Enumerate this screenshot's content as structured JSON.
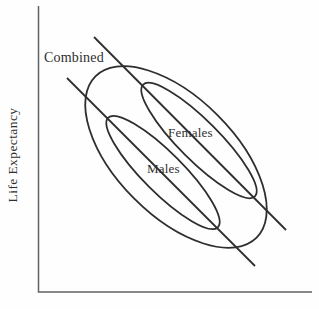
{
  "figure": {
    "y_axis_label": "Life Expectancy",
    "labels": {
      "combined": "Combined",
      "females": "Females",
      "males": "Males"
    },
    "colors": {
      "ink": "#2e2e2e",
      "axis": "#616161",
      "text": "#2f2f2f",
      "background": "#fefefe"
    }
  }
}
